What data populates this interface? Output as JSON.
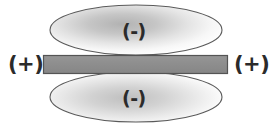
{
  "figure": {
    "background_color": "#ffffff"
  },
  "labels": {
    "positive_left": "(+)",
    "positive_right": "(+)",
    "negative_top": "(-)",
    "negative_bottom": "(-)"
  },
  "shapes": {
    "bar": {
      "name": "conductor-bar",
      "fill_color": "#8f8f8f",
      "stroke_color": "#545454",
      "x": 43,
      "y": 55,
      "width": 185,
      "height": 19
    },
    "ellipse_top": {
      "name": "upper-charge-cloud",
      "center_x": 136,
      "center_y": 30,
      "radius_x": 86,
      "radius_y": 25,
      "fill_light": "#fbfbfb",
      "fill_dark": "#b5b5b5",
      "stroke_color": "#5a5a5a"
    },
    "ellipse_bottom": {
      "name": "lower-charge-cloud",
      "center_x": 136,
      "center_y": 97,
      "radius_x": 86,
      "radius_y": 25,
      "fill_light": "#fbfbfb",
      "fill_dark": "#c2c2c2",
      "stroke_color": "#5a5a5a"
    }
  },
  "colors": {
    "text": "#2b2b2b",
    "bar_fill": "#8f8f8f",
    "bar_stroke": "#545454",
    "cloud_stroke": "#5a5a5a"
  }
}
